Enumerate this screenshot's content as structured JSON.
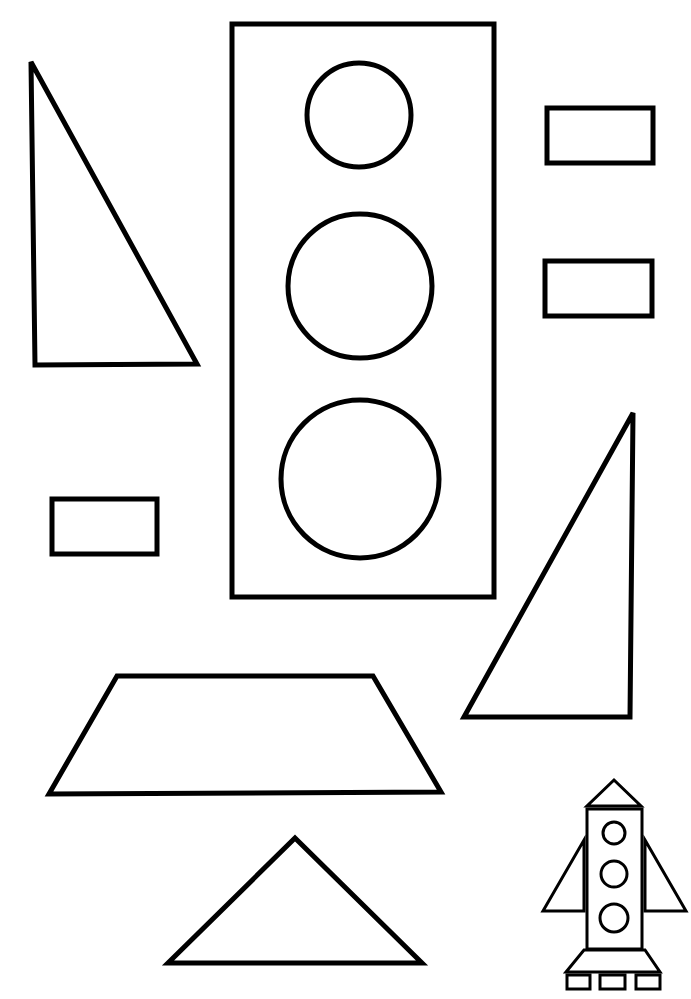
{
  "page": {
    "width": 691,
    "height": 999,
    "background": "#ffffff",
    "stroke_color": "#000000"
  },
  "shapes": [
    {
      "name": "large-right-triangle-left",
      "type": "polygon",
      "points": "31,62 35,365 197,364",
      "stroke": 5
    },
    {
      "name": "tall-rectangle-body",
      "type": "rect",
      "x": 232,
      "y": 24,
      "w": 262,
      "h": 573,
      "stroke": 5
    },
    {
      "name": "circle-top",
      "type": "circle",
      "cx": 359,
      "cy": 115,
      "r": 52,
      "stroke": 5
    },
    {
      "name": "circle-middle",
      "type": "circle",
      "cx": 360,
      "cy": 286,
      "r": 72,
      "stroke": 5
    },
    {
      "name": "circle-bottom",
      "type": "circle",
      "cx": 360,
      "cy": 479,
      "r": 79,
      "stroke": 5
    },
    {
      "name": "small-rectangle-top-right",
      "type": "rect",
      "x": 547,
      "y": 108,
      "w": 106,
      "h": 55,
      "stroke": 5
    },
    {
      "name": "small-rectangle-middle-right",
      "type": "rect",
      "x": 545,
      "y": 261,
      "w": 107,
      "h": 55,
      "stroke": 5
    },
    {
      "name": "small-rectangle-left",
      "type": "rect",
      "x": 52,
      "y": 499,
      "w": 105,
      "h": 55,
      "stroke": 5
    },
    {
      "name": "right-triangle-right",
      "type": "polygon",
      "points": "633,413 630,717 464,717",
      "stroke": 5
    },
    {
      "name": "trapezoid",
      "type": "polygon",
      "points": "117,676 373,676 441,792 49,794",
      "stroke": 5
    },
    {
      "name": "isosceles-triangle-bottom",
      "type": "polygon",
      "points": "295,838 422,963 168,963",
      "stroke": 5
    }
  ],
  "rocket": {
    "name": "rocket-example-icon",
    "shapes": [
      {
        "name": "rocket-nose-cone",
        "type": "polygon",
        "points": "614,780 641,806 587,806",
        "stroke": 3
      },
      {
        "name": "rocket-body",
        "type": "rect",
        "x": 587,
        "y": 809,
        "w": 55,
        "h": 140,
        "stroke": 3
      },
      {
        "name": "rocket-window-1",
        "type": "circle",
        "cx": 614,
        "cy": 833,
        "r": 11,
        "stroke": 3
      },
      {
        "name": "rocket-window-2",
        "type": "circle",
        "cx": 614,
        "cy": 874,
        "r": 13,
        "stroke": 3
      },
      {
        "name": "rocket-window-3",
        "type": "circle",
        "cx": 614,
        "cy": 918,
        "r": 14,
        "stroke": 3
      },
      {
        "name": "rocket-left-fin",
        "type": "polygon",
        "points": "584,840 584,911 543,911",
        "stroke": 3
      },
      {
        "name": "rocket-right-fin",
        "type": "polygon",
        "points": "645,840 686,911 645,911",
        "stroke": 3
      },
      {
        "name": "rocket-engine-base",
        "type": "polygon",
        "points": "584,950 645,950 660,972 566,972",
        "stroke": 3
      },
      {
        "name": "rocket-foot-1",
        "type": "rect",
        "x": 567,
        "y": 975,
        "w": 23,
        "h": 14,
        "stroke": 3
      },
      {
        "name": "rocket-foot-2",
        "type": "rect",
        "x": 600,
        "y": 975,
        "w": 25,
        "h": 14,
        "stroke": 3
      },
      {
        "name": "rocket-foot-3",
        "type": "rect",
        "x": 636,
        "y": 975,
        "w": 24,
        "h": 14,
        "stroke": 3
      }
    ]
  }
}
